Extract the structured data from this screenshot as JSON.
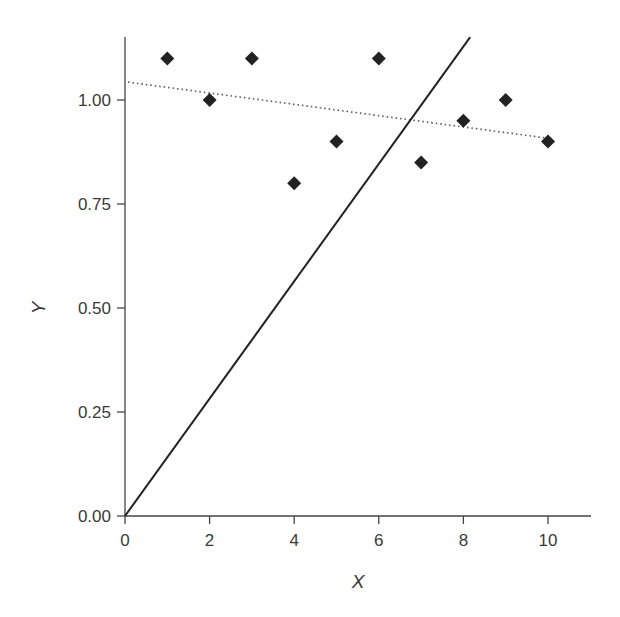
{
  "chart_data": {
    "type": "scatter",
    "title": "",
    "xlabel": "X",
    "ylabel": "Y",
    "xlim": [
      0,
      11
    ],
    "ylim": [
      0,
      1.15
    ],
    "grid": false,
    "legend": null,
    "x_ticks": [
      0,
      2,
      4,
      6,
      8,
      10
    ],
    "x_tick_labels": [
      "0",
      "2",
      "4",
      "6",
      "8",
      "10"
    ],
    "y_ticks": [
      0,
      0.25,
      0.5,
      0.75,
      1.0
    ],
    "y_tick_labels": [
      "0.00",
      "0.25",
      "0.50",
      "0.75",
      "1.00"
    ],
    "series": [
      {
        "name": "data points",
        "type": "scatter",
        "marker": "diamond",
        "color": "#222222",
        "x": [
          1,
          2,
          3,
          4,
          5,
          6,
          7,
          8,
          9,
          10
        ],
        "y": [
          1.1,
          1.0,
          1.1,
          0.8,
          0.9,
          1.1,
          0.85,
          0.95,
          1.0,
          0.9
        ]
      },
      {
        "name": "regression fit",
        "type": "line",
        "style": "dotted",
        "color": "#555555",
        "x": [
          0.07,
          9.93
        ],
        "y": [
          1.043,
          0.909
        ]
      },
      {
        "name": "line through origin",
        "type": "line",
        "style": "solid",
        "color": "#222222",
        "x": [
          0,
          8.16
        ],
        "y": [
          0,
          1.151
        ]
      }
    ]
  }
}
